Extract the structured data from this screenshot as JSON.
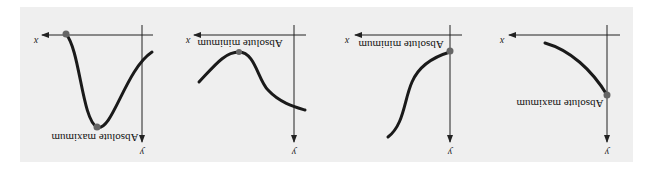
{
  "figure": {
    "orientation": "rotated 180 degrees",
    "background_color": "#efefef",
    "panels": [
      {
        "id": 1,
        "point_label": "Absolute maximum",
        "x_axis_label": "x",
        "y_axis_label": "y"
      },
      {
        "id": 2,
        "point_label": "Absolute minimum",
        "x_axis_label": "x",
        "y_axis_label": "y"
      },
      {
        "id": 3,
        "point_label": "Absolute minimum",
        "x_axis_label": "x",
        "y_axis_label": "y"
      },
      {
        "id": 4,
        "point_label": "Absolute maximum",
        "x_axis_label": "x",
        "y_axis_label": "y"
      }
    ]
  }
}
